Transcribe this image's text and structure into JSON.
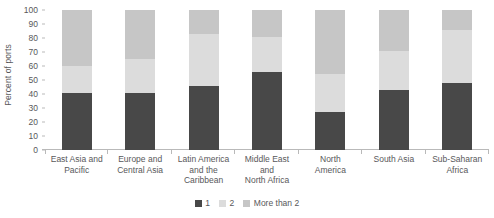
{
  "chart_data": {
    "type": "bar",
    "subtype": "stacked-bar-100",
    "title": "",
    "xlabel": "",
    "ylabel": "Percent of ports",
    "ylim": [
      0,
      100
    ],
    "yticks": [
      0,
      10,
      20,
      30,
      40,
      50,
      60,
      70,
      80,
      90,
      100
    ],
    "grid": false,
    "legend_position": "bottom-center",
    "categories": [
      "East Asia and Pacific",
      "Europe and Central Asia",
      "Latin America and the Caribbean",
      "Middle East and North Africa",
      "North America",
      "South Asia",
      "Sub-Saharan Africa"
    ],
    "series": [
      {
        "name": "1",
        "color": "#484848",
        "values": [
          41,
          41,
          46,
          56,
          27,
          43,
          48
        ]
      },
      {
        "name": "2",
        "color": "#dcdcdc",
        "values": [
          19,
          24,
          37,
          25,
          27,
          28,
          38
        ]
      },
      {
        "name": "More than 2",
        "color": "#c6c6c6",
        "values": [
          40,
          35,
          17,
          19,
          46,
          29,
          14
        ]
      }
    ]
  },
  "axis": {
    "y_title": "Percent of ports",
    "y_ticks": [
      "100",
      "90",
      "80",
      "70",
      "60",
      "50",
      "40",
      "30",
      "20",
      "10",
      "0"
    ]
  },
  "x_labels": [
    "East Asia and\nPacific",
    "Europe and\nCentral Asia",
    "Latin America\nand the\nCaribbean",
    "Middle East\nand\nNorth Africa",
    "North\nAmerica",
    "South Asia",
    "Sub-Saharan\nAfrica"
  ],
  "legend": {
    "items": [
      {
        "label": "1",
        "color": "#484848"
      },
      {
        "label": "2",
        "color": "#dcdcdc"
      },
      {
        "label": "More than 2",
        "color": "#c6c6c6"
      }
    ]
  }
}
